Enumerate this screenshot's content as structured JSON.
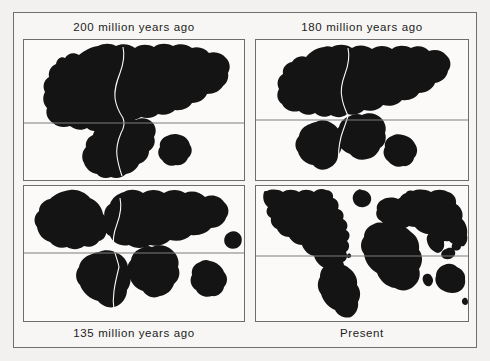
{
  "figure": {
    "type": "continental-drift-diagram",
    "background_color": "#f2f1ef",
    "frame_color": "#6f6f70",
    "land_color": "#141414",
    "map_background": "#fbfaf8",
    "equator_color": "#7d7d7e"
  },
  "panels": [
    {
      "id": "panel-200",
      "caption": "200 million years ago",
      "caption_position": "top",
      "equator_shown": true
    },
    {
      "id": "panel-180",
      "caption": "180 million years ago",
      "caption_position": "top",
      "equator_shown": true
    },
    {
      "id": "panel-135",
      "caption": "135 million years ago",
      "caption_position": "bottom",
      "equator_shown": true
    },
    {
      "id": "panel-present",
      "caption": "Present",
      "caption_position": "bottom",
      "equator_shown": true
    }
  ]
}
